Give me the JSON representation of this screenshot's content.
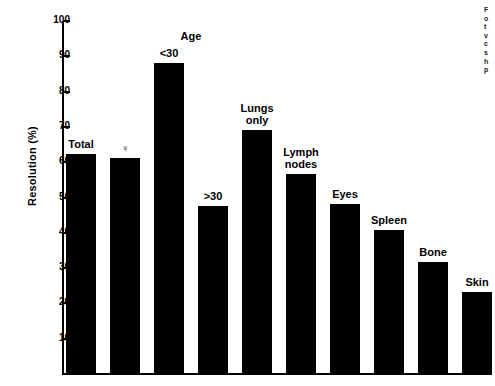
{
  "chart_data": {
    "type": "bar",
    "title": "",
    "xlabel": "",
    "ylabel": "Resolution (%)",
    "ylim": [
      0,
      100
    ],
    "ytick_values": [
      10,
      20,
      30,
      40,
      50,
      60,
      70,
      80,
      90,
      100
    ],
    "ytick_labels": [
      "10",
      "20",
      "30",
      "40",
      "50",
      "60",
      "70",
      "80",
      "90",
      "100"
    ],
    "grid": false,
    "legend": "none",
    "group_annotations": [
      {
        "text": "Age",
        "over_categories": [
          "<30",
          ">30"
        ]
      }
    ],
    "categories": [
      "Total",
      "♀",
      "<30",
      ">30",
      "Lungs only",
      "Lymph nodes",
      "Eyes",
      "Spleen",
      "Bone",
      "Skin"
    ],
    "values": [
      62.5,
      61.5,
      88.5,
      48,
      69.5,
      57,
      48.5,
      41,
      32,
      23.5
    ],
    "bars": [
      {
        "label": "Total",
        "label_lines": [
          "Total"
        ],
        "value": 62.5
      },
      {
        "label": "♀",
        "label_lines": [
          "♀"
        ],
        "value": 61.5
      },
      {
        "label": "<30",
        "label_lines": [
          "<30"
        ],
        "value": 88.5
      },
      {
        "label": ">30",
        "label_lines": [
          ">30"
        ],
        "value": 48
      },
      {
        "label": "Lungs only",
        "label_lines": [
          "Lungs",
          "only"
        ],
        "value": 69.5
      },
      {
        "label": "Lymph nodes",
        "label_lines": [
          "Lymph",
          "nodes"
        ],
        "value": 57
      },
      {
        "label": "Eyes",
        "label_lines": [
          "Eyes"
        ],
        "value": 48.5
      },
      {
        "label": "Spleen",
        "label_lines": [
          "Spleen"
        ],
        "value": 41
      },
      {
        "label": "Bone",
        "label_lines": [
          "Bone"
        ],
        "value": 32
      },
      {
        "label": "Skin",
        "label_lines": [
          "Skin"
        ],
        "value": 23.5
      }
    ],
    "bar_color": "#000000",
    "axis_color": "#000000",
    "background": "#ffffff"
  },
  "caption": {
    "cropped": true,
    "lines": [
      "F",
      "o",
      "t",
      "v",
      "c",
      "s",
      "h",
      "p"
    ]
  }
}
